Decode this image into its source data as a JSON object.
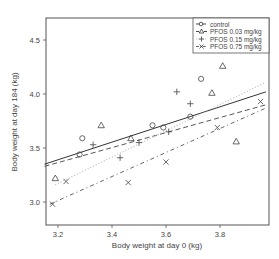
{
  "chart_data": {
    "type": "scatter",
    "title": "",
    "xlabel": "Body weight at day 0 (kg)",
    "ylabel": "Body weight at day 184 (kg)",
    "xlim": [
      3.15,
      3.97
    ],
    "ylim": [
      2.78,
      4.68
    ],
    "xticks": [
      3.2,
      3.4,
      3.6,
      3.8
    ],
    "xtick_labels": [
      "3.2",
      "3.4",
      "3.6",
      "3.8"
    ],
    "yticks": [
      3.0,
      3.5,
      4.0,
      4.5
    ],
    "ytick_labels": [
      "3.0",
      "3.5",
      "4.0",
      "4.5"
    ],
    "grid": false,
    "legend_position": "upper right",
    "series": [
      {
        "name": "control",
        "marker": "circle",
        "line_style": "solid",
        "points": [
          [
            3.29,
            3.59
          ],
          [
            3.28,
            3.44
          ],
          [
            3.55,
            3.71
          ],
          [
            3.59,
            3.69
          ],
          [
            3.69,
            3.79
          ],
          [
            3.73,
            4.14
          ]
        ],
        "fit_line": [
          [
            3.15,
            3.35
          ],
          [
            3.97,
            4.02
          ]
        ]
      },
      {
        "name": "PFOS 0.03 mg/kg",
        "marker": "triangle",
        "line_style": "dashed",
        "points": [
          [
            3.19,
            3.22
          ],
          [
            3.36,
            3.71
          ],
          [
            3.47,
            3.59
          ],
          [
            3.77,
            4.01
          ],
          [
            3.81,
            4.26
          ],
          [
            3.86,
            3.56
          ]
        ],
        "fit_line": [
          [
            3.15,
            3.33
          ],
          [
            3.97,
            3.9
          ]
        ]
      },
      {
        "name": "PFOS 0.15 mg/kg",
        "marker": "plus",
        "line_style": "dotted",
        "points": [
          [
            3.33,
            3.53
          ],
          [
            3.43,
            3.41
          ],
          [
            3.5,
            3.55
          ],
          [
            3.61,
            3.65
          ],
          [
            3.64,
            4.02
          ],
          [
            3.69,
            3.91
          ]
        ],
        "fit_line": [
          [
            3.19,
            3.16
          ],
          [
            3.97,
            4.11
          ]
        ]
      },
      {
        "name": "PFOS 0.75 mg/kg",
        "marker": "x",
        "line_style": "dotdash",
        "points": [
          [
            3.18,
            2.98
          ],
          [
            3.23,
            3.19
          ],
          [
            3.46,
            3.18
          ],
          [
            3.6,
            3.37
          ],
          [
            3.79,
            3.69
          ],
          [
            3.95,
            3.93
          ]
        ],
        "fit_line": [
          [
            3.17,
            2.98
          ],
          [
            3.97,
            3.87
          ]
        ]
      }
    ]
  },
  "legend": {
    "items": [
      {
        "label": "control"
      },
      {
        "label": "PFOS 0.03 mg/kg"
      },
      {
        "label": "PFOS 0.15 mg/kg"
      },
      {
        "label": "PFOS 0.75 mg/kg"
      }
    ]
  }
}
